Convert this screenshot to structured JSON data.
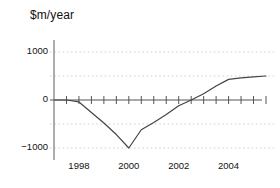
{
  "chart_data": {
    "type": "line",
    "title": "$m/year",
    "xlabel": "",
    "ylabel": "",
    "grid": true,
    "legend": null,
    "xlim": [
      1997.0,
      2005.5
    ],
    "ylim": [
      -1250,
      1250
    ],
    "y_gridlines": [
      1000,
      500,
      -500,
      -1000
    ],
    "y_ticks": [
      1000,
      0,
      -1000
    ],
    "y_tick_labels": [
      "1000",
      "0",
      "−1000"
    ],
    "x_ticks": [
      1997.5,
      1998,
      1998.5,
      1999,
      1999.5,
      2000,
      2000.5,
      2001,
      2001.5,
      2002,
      2002.5,
      2003,
      2003.5,
      2004,
      2004.5,
      2005,
      2005.5
    ],
    "x_tick_labels_shown": [
      "1998",
      "2000",
      "2002",
      "2004"
    ],
    "x_label_values": [
      1998,
      2000,
      2002,
      2004
    ],
    "series": [
      {
        "name": "$m/year",
        "color": "#444444",
        "x": [
          1997.0,
          1997.5,
          1998.0,
          1998.5,
          1999.0,
          1999.5,
          2000.0,
          2000.5,
          2001.0,
          2001.5,
          2002.0,
          2002.5,
          2003.0,
          2003.5,
          2004.0,
          2004.5,
          2005.0,
          2005.5
        ],
        "values": [
          0,
          0,
          -40,
          -260,
          -480,
          -720,
          -1000,
          -620,
          -470,
          -300,
          -120,
          0,
          130,
          290,
          430,
          460,
          480,
          500
        ]
      }
    ]
  },
  "axis": {
    "zero_line_color": "#555555",
    "grid_color": "#cfcfcf",
    "y_axis_color": "#8a8a8a"
  }
}
